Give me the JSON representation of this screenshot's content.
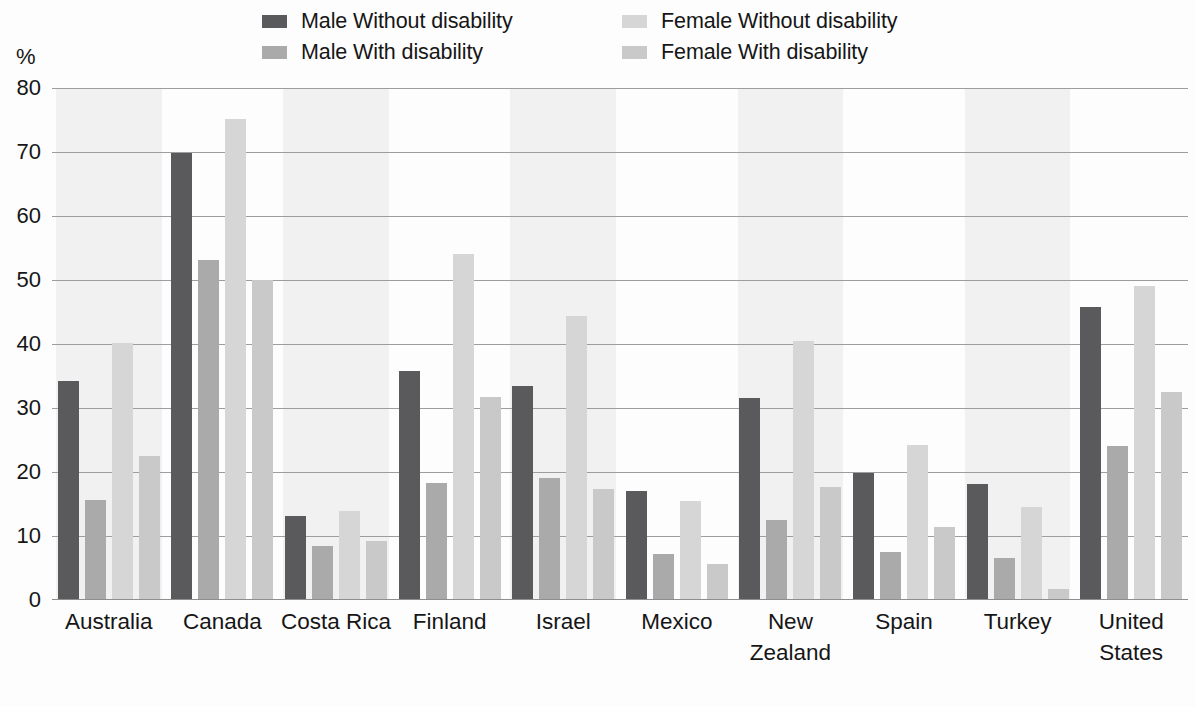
{
  "axis": {
    "y_unit_label": "%",
    "y_ticks": [
      "80",
      "70",
      "60",
      "50",
      "40",
      "30",
      "20",
      "10",
      "0"
    ]
  },
  "legend": {
    "items": [
      {
        "label": "Male Without disability",
        "color": "#5a5a5c",
        "icon": "legend-swatch-icon"
      },
      {
        "label": "Female Without disability",
        "color": "#d6d6d6",
        "icon": "legend-swatch-icon"
      },
      {
        "label": "Male With disability",
        "color": "#aaaaaa",
        "icon": "legend-swatch-icon"
      },
      {
        "label": "Female With disability",
        "color": "#c9c9c9",
        "icon": "legend-swatch-icon"
      }
    ]
  },
  "chart_data": {
    "type": "bar",
    "title": "",
    "xlabel": "",
    "ylabel": "%",
    "ylim": [
      0,
      80
    ],
    "ytick_step": 10,
    "grid": true,
    "legend_position": "top",
    "categories": [
      "Australia",
      "Canada",
      "Costa Rica",
      "Finland",
      "Israel",
      "Mexico",
      "New\nZealand",
      "Spain",
      "Turkey",
      "United\nStates"
    ],
    "series": [
      {
        "name": "Male Without disability",
        "color": "#5a5a5c",
        "values": [
          34.2,
          69.9,
          13.1,
          35.8,
          33.4,
          17.0,
          31.6,
          19.8,
          18.2,
          45.8
        ]
      },
      {
        "name": "Male With disability",
        "color": "#aaaaaa",
        "values": [
          15.6,
          53.2,
          8.4,
          18.3,
          19.0,
          7.2,
          12.5,
          7.5,
          6.5,
          24.1
        ]
      },
      {
        "name": "Female Without disability",
        "color": "#d6d6d6",
        "values": [
          40.2,
          75.2,
          13.9,
          54.0,
          44.4,
          15.4,
          40.4,
          24.2,
          14.5,
          49.0
        ]
      },
      {
        "name": "Female With disability",
        "color": "#c9c9c9",
        "values": [
          22.5,
          50.0,
          9.2,
          31.7,
          17.3,
          5.7,
          17.6,
          11.4,
          1.7,
          32.5
        ]
      }
    ]
  }
}
